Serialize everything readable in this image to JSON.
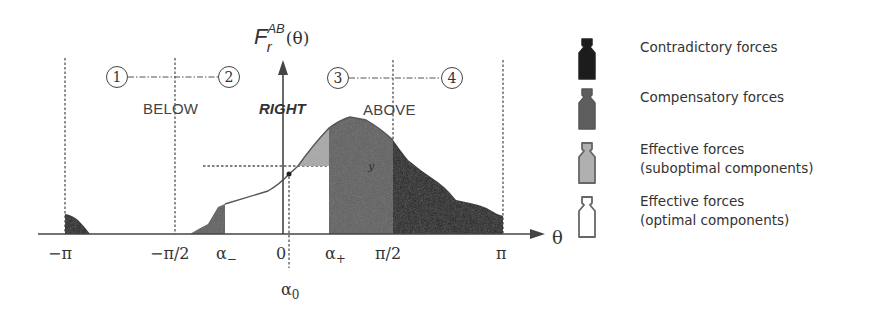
{
  "diagram": {
    "y_axis_label": {
      "main": "F",
      "superscript": "AB",
      "subscript": "r",
      "argument": "(θ)"
    },
    "x_axis_label": "θ",
    "x_ticks": {
      "neg_pi": "−π",
      "neg_half_pi": "−π/2",
      "alpha_minus": "α",
      "alpha_minus_sub": "−",
      "zero": "0",
      "alpha_plus": "α",
      "alpha_plus_sub": "+",
      "half_pi": "π/2",
      "pi": "π",
      "alpha_zero": "α",
      "alpha_zero_sub": "0"
    },
    "regions": {
      "below": "BELOW",
      "right": "RIGHT",
      "above": "ABOVE"
    },
    "quadrant_markers": [
      "1",
      "2",
      "3",
      "4"
    ],
    "marker_y": "y",
    "colors": {
      "contradictory": "#1c1c1c",
      "compensatory": "#5e5e5e",
      "suboptimal": "#a8a8a8",
      "optimal": "#ffffff",
      "line": "#555555"
    }
  },
  "legend": {
    "items": [
      {
        "icon": "weight-black-icon",
        "lines": [
          "Contradictory forces"
        ]
      },
      {
        "icon": "weight-dark-gray-icon",
        "lines": [
          "Compensatory forces"
        ]
      },
      {
        "icon": "weight-light-gray-icon",
        "lines": [
          "Effective forces",
          "(suboptimal components)"
        ]
      },
      {
        "icon": "weight-white-icon",
        "lines": [
          "Effective forces",
          "(optimal components)"
        ]
      }
    ]
  }
}
